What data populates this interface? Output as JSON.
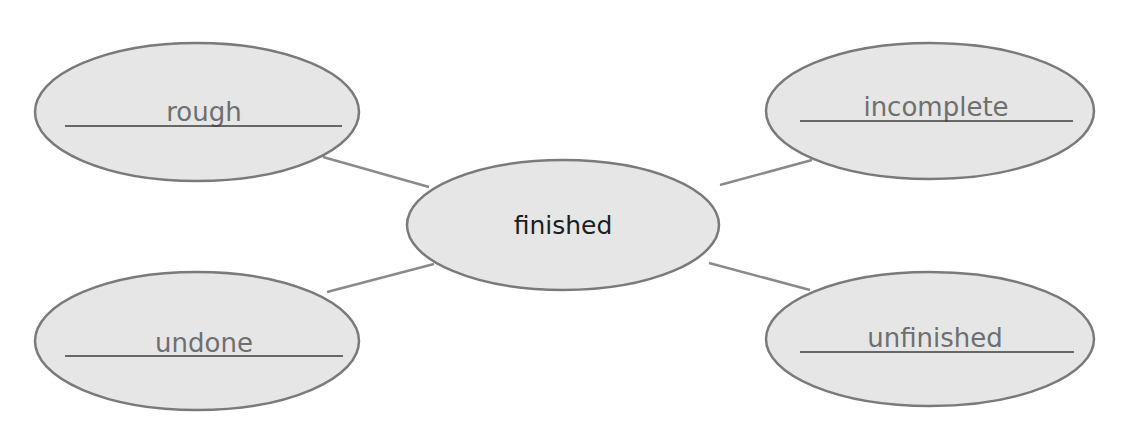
{
  "diagram": {
    "type": "word-web",
    "center": {
      "label": "finished",
      "cx": 563,
      "cy": 225,
      "rx": 156,
      "ry": 65,
      "text_y": 234
    },
    "nodes": [
      {
        "id": "rough",
        "label": "rough",
        "cx": 197,
        "cy": 112,
        "rx": 162,
        "ry": 69,
        "text_x": 204,
        "text_y": 121,
        "underline": {
          "x1": 65,
          "x2": 342,
          "y": 126
        },
        "connector": {
          "x1": 323,
          "y1": 157,
          "x2": 429,
          "y2": 187
        }
      },
      {
        "id": "incomplete",
        "label": "incomplete",
        "cx": 930,
        "cy": 111,
        "rx": 164,
        "ry": 68,
        "text_x": 936,
        "text_y": 116,
        "underline": {
          "x1": 800,
          "x2": 1073,
          "y": 121
        },
        "connector": {
          "x1": 720,
          "y1": 185,
          "x2": 812,
          "y2": 160
        }
      },
      {
        "id": "undone",
        "label": "undone",
        "cx": 197,
        "cy": 341,
        "rx": 162,
        "ry": 69,
        "text_x": 204,
        "text_y": 352,
        "underline": {
          "x1": 65,
          "x2": 343,
          "y": 356
        },
        "connector": {
          "x1": 327,
          "y1": 292,
          "x2": 434,
          "y2": 264
        }
      },
      {
        "id": "unfinished",
        "label": "unfinished",
        "cx": 930,
        "cy": 339,
        "rx": 164,
        "ry": 67,
        "text_x": 935,
        "text_y": 347,
        "underline": {
          "x1": 800,
          "x2": 1074,
          "y": 352
        },
        "connector": {
          "x1": 709,
          "y1": 263,
          "x2": 810,
          "y2": 290
        }
      }
    ],
    "colors": {
      "ellipse_fill": "#e6e6e6",
      "ellipse_stroke": "#7a7a7a",
      "connector": "#8a8a8a",
      "underline": "#3c3c3c",
      "center_text": "#1e1e1e",
      "outer_text": "#6f6f6f",
      "background": "#ffffff"
    }
  }
}
